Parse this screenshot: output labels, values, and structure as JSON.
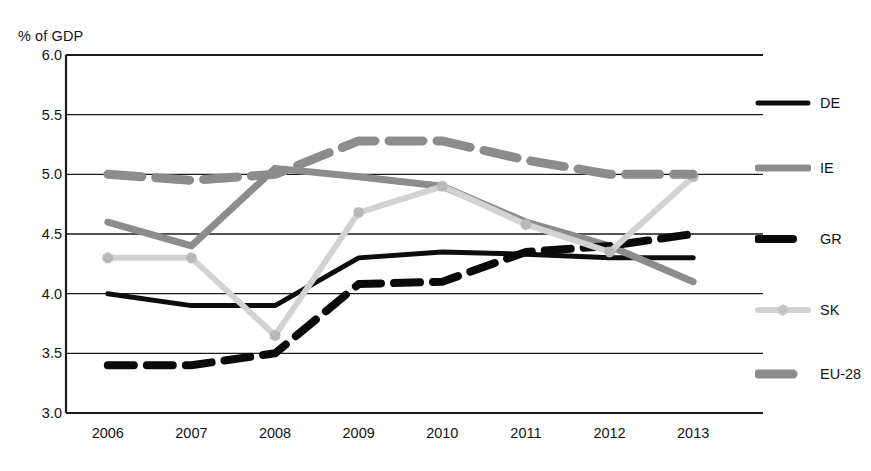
{
  "chart_data": {
    "type": "line",
    "title": "",
    "subtitle": "",
    "ylabel": "% of GDP",
    "xlabel": "",
    "categories": [
      "2006",
      "2007",
      "2008",
      "2009",
      "2010",
      "2011",
      "2012",
      "2013"
    ],
    "x": [
      2006,
      2007,
      2008,
      2009,
      2010,
      2011,
      2012,
      2013
    ],
    "ylim": [
      3.0,
      6.0
    ],
    "ytick_step": 0.5,
    "yticks": [
      "6.0",
      "5.5",
      "5.0",
      "4.5",
      "4.0",
      "3.5",
      "3.0"
    ],
    "ytick_values": [
      6.0,
      5.5,
      5.0,
      4.5,
      4.0,
      3.5,
      3.0
    ],
    "grid": true,
    "grid_axis": "y",
    "legend_position": "right",
    "series": [
      {
        "name": "DE",
        "values": [
          4.0,
          3.9,
          3.9,
          4.3,
          4.35,
          4.33,
          4.3,
          4.3
        ],
        "color": "#0d0d0d",
        "style": "solid",
        "width": 5,
        "marker": "none"
      },
      {
        "name": "IE",
        "values": [
          4.6,
          4.4,
          5.05,
          4.98,
          4.9,
          4.6,
          4.4,
          4.1
        ],
        "color": "#8c8c8c",
        "style": "solid",
        "width": 7,
        "marker": "none"
      },
      {
        "name": "GR",
        "values": [
          3.4,
          3.4,
          3.5,
          4.08,
          4.1,
          4.35,
          4.4,
          4.5
        ],
        "color": "#0a0a0a",
        "style": "dashed",
        "width": 8,
        "marker": "none"
      },
      {
        "name": "SK",
        "values": [
          4.3,
          4.3,
          3.65,
          4.68,
          4.9,
          4.58,
          4.35,
          4.98
        ],
        "color": "#d2d2d2",
        "style": "solid",
        "width": 6,
        "marker": "star"
      },
      {
        "name": "EU-28",
        "values": [
          5.0,
          4.95,
          5.0,
          5.28,
          5.28,
          5.12,
          5.0,
          5.0
        ],
        "color": "#8c8c8c",
        "style": "dashed",
        "width": 9,
        "marker": "none"
      }
    ]
  },
  "legend": {
    "items": [
      {
        "label": "DE"
      },
      {
        "label": "IE"
      },
      {
        "label": "GR"
      },
      {
        "label": "SK"
      },
      {
        "label": "EU-28"
      }
    ]
  }
}
